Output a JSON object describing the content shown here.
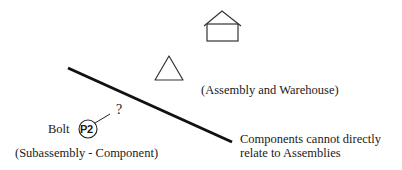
{
  "diagram": {
    "icons": {
      "house": "house-icon",
      "triangle": "triangle-icon",
      "part_circle": "part-circle-icon"
    },
    "labels": {
      "assembly_warehouse": "(Assembly and Warehouse)",
      "bolt": "Bolt",
      "part_code": "P2",
      "question": "?",
      "subassembly_component": "(Subassembly - Component)",
      "note": "Components cannot directly relate to Assemblies"
    },
    "colors": {
      "stroke": "#1a1a1a",
      "background": "#ffffff"
    }
  }
}
